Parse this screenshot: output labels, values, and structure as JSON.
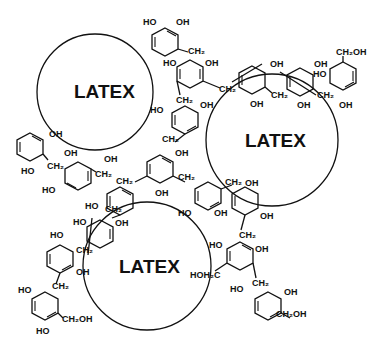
{
  "diagram": {
    "type": "chemical-structure",
    "background": "#ffffff",
    "line_color": "#111111",
    "latex_particles": [
      {
        "label": "LATEX",
        "cx": 95,
        "cy": 92,
        "r": 58
      },
      {
        "label": "LATEX",
        "cx": 272,
        "cy": 140,
        "r": 66
      },
      {
        "label": "LATEX",
        "cx": 147,
        "cy": 266,
        "r": 64
      }
    ],
    "group_labels": {
      "oh": "OH",
      "ho": "HO",
      "ch2": "CH₂",
      "ch2oh": "CH₂OH",
      "hoh2c": "HOH₂C"
    }
  }
}
